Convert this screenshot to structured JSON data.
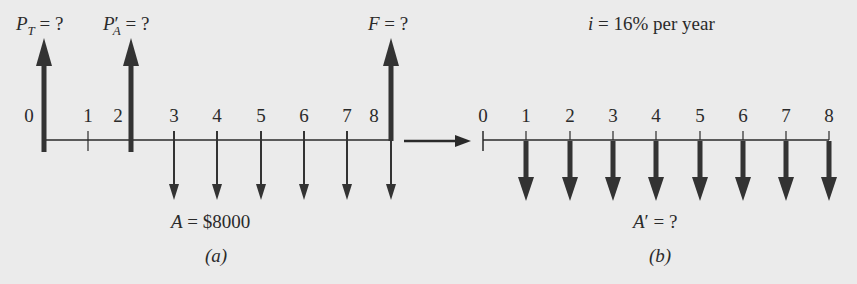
{
  "diagram_a": {
    "caption": "(a)",
    "labels": {
      "pt_var": "P",
      "pt_sub": "T",
      "pt_rest": " = ?",
      "pa_var": "P",
      "pa_prime": "′",
      "pa_sub": "A",
      "pa_rest": " = ?",
      "f_var": "F",
      "f_rest": " = ?",
      "a_var": "A",
      "a_rest": " = $8000"
    },
    "periods": [
      "0",
      "1",
      "2",
      "3",
      "4",
      "5",
      "6",
      "7",
      "8"
    ],
    "up_arrows_at": [
      0,
      2,
      8
    ],
    "down_arrows_at": [
      3,
      4,
      5,
      6,
      7,
      8
    ],
    "annual_amount": "$8000"
  },
  "diagram_b": {
    "caption": "(b)",
    "interest_var": "i",
    "interest_rest": " = 16% per year",
    "labels": {
      "ap_var": "A",
      "ap_rest": "′ = ?"
    },
    "periods": [
      "0",
      "1",
      "2",
      "3",
      "4",
      "5",
      "6",
      "7",
      "8"
    ],
    "down_arrows_at": [
      1,
      2,
      3,
      4,
      5,
      6,
      7,
      8
    ]
  },
  "colors": {
    "background": "#ebebeb",
    "ink": "#2a2a2a",
    "arrow": "#333333"
  }
}
